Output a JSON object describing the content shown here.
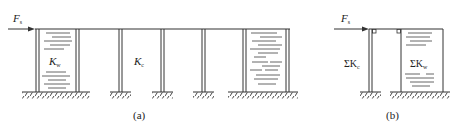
{
  "figure_a": {
    "caption": "(a)",
    "force_label": "F",
    "force_sub": "s",
    "wall_label": "K",
    "wall_sub": "w",
    "column_label": "K",
    "column_sub": "c"
  },
  "figure_b": {
    "caption": "(b)",
    "force_label": "F",
    "force_sub": "s",
    "column_label": "ΣK",
    "column_sub": "c",
    "wall_label": "ΣK",
    "wall_sub": "w"
  },
  "colors": {
    "line": "#333333",
    "background": "#ffffff"
  }
}
